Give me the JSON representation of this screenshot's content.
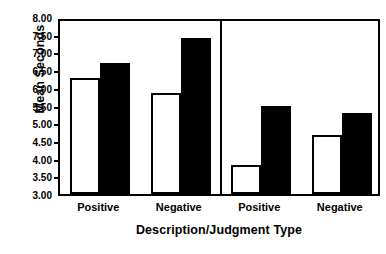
{
  "chart_data": {
    "type": "bar",
    "title": "",
    "subtitle": "",
    "xlabel": "Description/Judgment Type",
    "ylabel": "Mean Seconds",
    "categories": [
      "Positive",
      "Negative",
      "Positive",
      "Negative"
    ],
    "ylim": [
      3.0,
      8.0
    ],
    "ytick_step": 0.5,
    "ytick_labels": [
      "8.00",
      "7.50",
      "7.00",
      "6.50",
      "6.00",
      "5.50",
      "5.00",
      "4.50",
      "4.00",
      "3.50",
      "3.00"
    ],
    "ytick_values": [
      8.0,
      7.5,
      7.0,
      6.5,
      6.0,
      5.5,
      5.0,
      4.5,
      4.0,
      3.5,
      3.0
    ],
    "grid": false,
    "legend": "none",
    "panels": [
      {
        "name": "left-panel",
        "groups": [
          {
            "label": "Positive",
            "open": 6.28,
            "filled": 6.7
          },
          {
            "label": "Negative",
            "open": 5.85,
            "filled": 7.42
          }
        ]
      },
      {
        "name": "right-panel",
        "groups": [
          {
            "label": "Positive",
            "open": 3.82,
            "filled": 5.48
          },
          {
            "label": "Negative",
            "open": 4.68,
            "filled": 5.3
          }
        ]
      }
    ],
    "series": [
      {
        "name": "open-bar",
        "fill": "#ffffff",
        "values": [
          6.28,
          5.85,
          3.82,
          4.68
        ]
      },
      {
        "name": "filled-bar",
        "fill": "#000000",
        "values": [
          6.7,
          7.42,
          5.48,
          5.3
        ]
      }
    ],
    "colors": {
      "axis": "#000000",
      "open_bar_fill": "#ffffff",
      "filled_bar_fill": "#000000",
      "background": "#ffffff"
    }
  }
}
